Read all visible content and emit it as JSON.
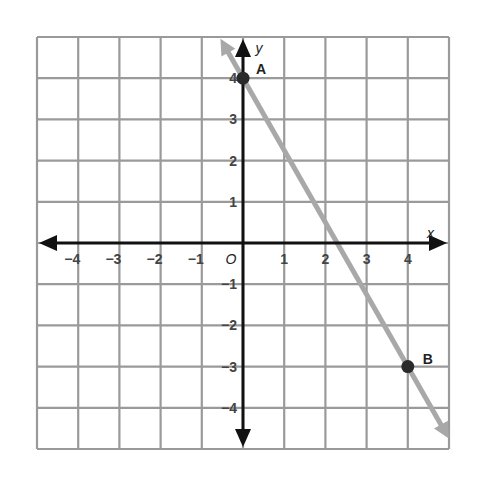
{
  "chart_data": {
    "type": "line",
    "title": "",
    "xlabel": "x",
    "ylabel": "y",
    "xlim": [
      -5,
      5
    ],
    "ylim": [
      -5,
      5
    ],
    "grid": true,
    "x_ticks": [
      "-4",
      "-3",
      "-2",
      "-1",
      "1",
      "2",
      "3",
      "4"
    ],
    "y_ticks": [
      "4",
      "3",
      "2",
      "1",
      "-1",
      "-2",
      "-3",
      "-4"
    ],
    "origin_label": "O",
    "points": [
      {
        "label": "A",
        "x": 0,
        "y": 4
      },
      {
        "label": "B",
        "x": 4,
        "y": -3
      }
    ],
    "line": {
      "slope": -1.75,
      "intercept": 4,
      "through": [
        "A",
        "B"
      ],
      "color": "#a8a8a8"
    },
    "colors": {
      "grid": "#9a9a9a",
      "axis": "#111111",
      "line": "#a8a8a8",
      "point": "#2a2a2a"
    }
  }
}
